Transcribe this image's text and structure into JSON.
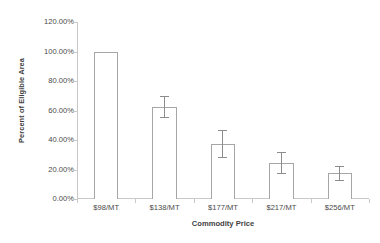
{
  "chart_data": {
    "type": "bar",
    "title": "",
    "subtitle": "",
    "xlabel": "Commodity Price",
    "ylabel": "Percent of Eligible Area",
    "categories": [
      "$98/MT",
      "$138/MT",
      "$177/MT",
      "$217/MT",
      "$256/MT"
    ],
    "values": [
      1.0,
      0.625,
      0.373,
      0.242,
      0.174
    ],
    "errors": [
      0,
      0.075,
      0.098,
      0.075,
      0.05
    ],
    "value_labels": [
      "100.00%",
      "62.50%",
      "37.30%",
      "24.20%",
      "17.40%"
    ],
    "ylim": [
      0,
      1.2
    ],
    "yticks": [
      0,
      0.2,
      0.4,
      0.6,
      0.8,
      1.0,
      1.2
    ],
    "ytick_labels": [
      "0.00%",
      "20.00%",
      "40.00%",
      "60.00%",
      "80.00%",
      "100.00%",
      "120.00%"
    ],
    "grid": false,
    "legend": null,
    "legend_position": "none",
    "series": [
      {
        "name": "Percent of Eligible Area",
        "values": [
          1.0,
          0.625,
          0.373,
          0.242,
          0.174
        ],
        "errors": [
          0,
          0.075,
          0.098,
          0.075,
          0.05
        ]
      }
    ],
    "colors": {
      "bar_fill": "#ffffff",
      "bar_outline": "#a6a6a6",
      "error_bar": "#8c8c8c",
      "axis": "#c9c9c9",
      "text": "#4a4a4a",
      "background": "#ffffff"
    }
  }
}
